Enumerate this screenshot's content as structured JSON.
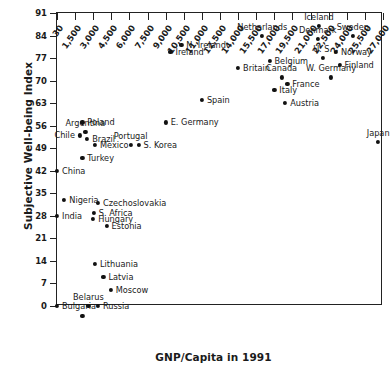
{
  "chart_data": {
    "type": "scatter",
    "title": "",
    "xlabel": "GNP/Capita in 1991",
    "ylabel": "Subjective Well-being Index",
    "xlim": [
      30,
      27000
    ],
    "ylim": [
      0,
      91
    ],
    "grid": false,
    "legend": "none",
    "xticks": [
      "30",
      "1,500",
      "3,000",
      "4,500",
      "6,000",
      "7,500",
      "9,000",
      "10,500",
      "11,000",
      "12,500",
      "14,000",
      "15,500",
      "17,000",
      "19,500",
      "21,000",
      "22,500",
      "24,000",
      "25,500",
      "27,000"
    ],
    "yticks": [
      "0",
      "7",
      "14",
      "21",
      "28",
      "35",
      "42",
      "49",
      "56",
      "63",
      "70",
      "77",
      "84",
      "91"
    ],
    "points": [
      {
        "label": "Bulgaria",
        "x": 30,
        "y": 0,
        "pos": "r"
      },
      {
        "label": "Belarus",
        "x": 2600,
        "y": 0,
        "pos": "c"
      },
      {
        "label": "Russia",
        "x": 3400,
        "y": 0,
        "pos": "r"
      },
      {
        "label": "",
        "x": 2100,
        "y": -3,
        "pos": "r"
      },
      {
        "label": "Moscow",
        "x": 4450,
        "y": 5,
        "pos": "r"
      },
      {
        "label": "Latvia",
        "x": 3850,
        "y": 9,
        "pos": "r"
      },
      {
        "label": "Lithuania",
        "x": 3150,
        "y": 13,
        "pos": "r"
      },
      {
        "label": "Estonia",
        "x": 4100,
        "y": 25,
        "pos": "r"
      },
      {
        "label": "Hungary",
        "x": 3000,
        "y": 27,
        "pos": "r"
      },
      {
        "label": "India",
        "x": 30,
        "y": 28,
        "pos": "r"
      },
      {
        "label": "S. Africa",
        "x": 3050,
        "y": 29,
        "pos": "r"
      },
      {
        "label": "Czechoslovakia",
        "x": 3400,
        "y": 32,
        "pos": "r"
      },
      {
        "label": "Nigeria",
        "x": 620,
        "y": 33,
        "pos": "r"
      },
      {
        "label": "China",
        "x": 30,
        "y": 42,
        "pos": "r"
      },
      {
        "label": "Turkey",
        "x": 2100,
        "y": 46,
        "pos": "r"
      },
      {
        "label": "Portugal",
        "x": 6100,
        "y": 50,
        "pos": "c"
      },
      {
        "label": "Mexico",
        "x": 3150,
        "y": 50,
        "pos": "r"
      },
      {
        "label": "S. Korea",
        "x": 6750,
        "y": 50,
        "pos": "r"
      },
      {
        "label": "Japan",
        "x": 26600,
        "y": 51,
        "pos": "c"
      },
      {
        "label": "Chile",
        "x": 1900,
        "y": 53,
        "pos": "l"
      },
      {
        "label": "Brazil",
        "x": 2500,
        "y": 52,
        "pos": "r"
      },
      {
        "label": "Argentina",
        "x": 2350,
        "y": 54,
        "pos": "c"
      },
      {
        "label": "Poland",
        "x": 2100,
        "y": 57,
        "pos": "r"
      },
      {
        "label": "E. Germany",
        "x": 9000,
        "y": 57,
        "pos": "r"
      },
      {
        "label": "Spain",
        "x": 11000,
        "y": 64,
        "pos": "r"
      },
      {
        "label": "Austria",
        "x": 18500,
        "y": 63,
        "pos": "r"
      },
      {
        "label": "Italy",
        "x": 17000,
        "y": 67,
        "pos": "r"
      },
      {
        "label": "France",
        "x": 18800,
        "y": 69,
        "pos": "r"
      },
      {
        "label": "Canada",
        "x": 18000,
        "y": 71,
        "pos": "c"
      },
      {
        "label": "W. Germany",
        "x": 22700,
        "y": 71,
        "pos": "c"
      },
      {
        "label": "Britain",
        "x": 14000,
        "y": 74,
        "pos": "r"
      },
      {
        "label": "Finland",
        "x": 23400,
        "y": 75,
        "pos": "r"
      },
      {
        "label": "Belgium",
        "x": 16600,
        "y": 76,
        "pos": "r"
      },
      {
        "label": "U. S.",
        "x": 22000,
        "y": 77,
        "pos": "c"
      },
      {
        "label": "Ireland",
        "x": 9400,
        "y": 79,
        "pos": "r"
      },
      {
        "label": "Norway",
        "x": 23100,
        "y": 79,
        "pos": "r"
      },
      {
        "label": "N. Ireland",
        "x": 10300,
        "y": 81,
        "pos": "r"
      },
      {
        "label": "Denmark",
        "x": 21600,
        "y": 83,
        "pos": "c"
      },
      {
        "label": "Sweden",
        "x": 24500,
        "y": 84,
        "pos": "c"
      },
      {
        "label": "Netherlands",
        "x": 16000,
        "y": 84,
        "pos": "c"
      },
      {
        "label": "Iceland",
        "x": 21700,
        "y": 87,
        "pos": "c"
      }
    ]
  }
}
